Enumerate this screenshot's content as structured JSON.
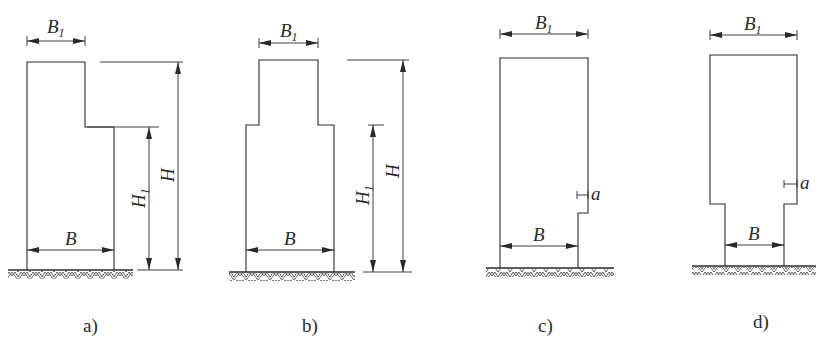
{
  "figure": {
    "panels": [
      {
        "id": "a",
        "caption": "a)",
        "labels": {
          "top_width": "B",
          "top_width_sub": "1",
          "base_width": "B",
          "total_height": "H",
          "lower_height": "H",
          "lower_height_sub": "1"
        }
      },
      {
        "id": "b",
        "caption": "b)",
        "labels": {
          "top_width": "B",
          "top_width_sub": "1",
          "base_width": "B",
          "total_height": "H",
          "lower_height": "H",
          "lower_height_sub": "1"
        }
      },
      {
        "id": "c",
        "caption": "c)",
        "labels": {
          "top_width": "B",
          "top_width_sub": "1",
          "base_width": "B",
          "offset": "a"
        }
      },
      {
        "id": "d",
        "caption": "d)",
        "labels": {
          "top_width": "B",
          "top_width_sub": "1",
          "base_width": "B",
          "offset": "a"
        }
      }
    ]
  }
}
